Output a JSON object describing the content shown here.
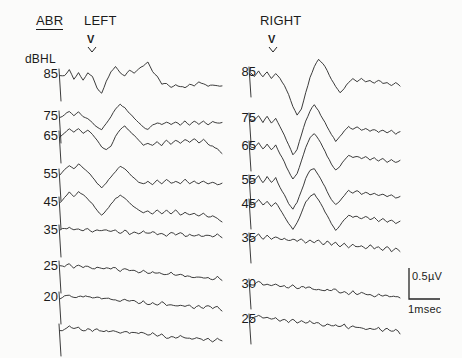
{
  "header": {
    "test_name": "ABR",
    "left_ear_label": "LEFT",
    "right_ear_label": "RIGHT",
    "intensity_unit": "dBHL",
    "wave_marker_left": "V",
    "wave_marker_right": "V"
  },
  "scalebar": {
    "amplitude_label": "0.5µV",
    "time_label": "1msec",
    "amplitude_value": 0.5,
    "amplitude_unit": "µV",
    "time_value": 1,
    "time_unit": "msec"
  },
  "left_levels": [
    "85",
    "75",
    "65",
    "55",
    "45",
    "35",
    "25",
    "20"
  ],
  "right_levels": [
    "85",
    "75",
    "65",
    "55",
    "45",
    "35",
    "30",
    "25"
  ],
  "chart_data": {
    "type": "line",
    "title": "ABR",
    "subtitle": "",
    "xlabel": "Time (msec)",
    "ylabel": "Stimulus intensity (dBHL)",
    "grid": false,
    "legend_position": "none",
    "annotations": [
      {
        "text": "V",
        "ear": "left",
        "meaning": "wave-V latency marker"
      },
      {
        "text": "V",
        "ear": "right",
        "meaning": "wave-V latency marker"
      }
    ],
    "amplitude_scale_uV": 0.5,
    "time_scale_msec": 1,
    "panels": [
      {
        "name": "LEFT",
        "ylabel": "dBHL",
        "categories": [
          "85",
          "75",
          "65",
          "55",
          "45",
          "35",
          "25",
          "20",
          ""
        ],
        "series": [
          {
            "name": "85 dBHL",
            "level": 85,
            "baseline_y": 75,
            "values": [
              0,
              -1,
              5,
              -5,
              3,
              -6,
              2,
              -1,
              -14,
              -19,
              -6,
              4,
              9,
              2,
              -1,
              5,
              2,
              6,
              10,
              13,
              4,
              -2,
              -10,
              -9,
              -13,
              -10,
              -12,
              -13,
              -10,
              -11,
              -8,
              -10,
              -12,
              -10,
              -12,
              -11
            ]
          },
          {
            "name": "75 dBHL",
            "level": 75,
            "baseline_y": 117,
            "values": [
              0,
              3,
              6,
              2,
              5,
              1,
              -2,
              -6,
              -11,
              -13,
              -6,
              1,
              8,
              13,
              10,
              4,
              -1,
              -6,
              -10,
              -13,
              -9,
              -6,
              -8,
              -5,
              -8,
              -5,
              -8,
              -4,
              -8,
              -5,
              -8,
              -5,
              -8,
              -5,
              -7,
              -5
            ]
          },
          {
            "name": "65 dBHL",
            "level": 65,
            "baseline_y": 137,
            "values": [
              0,
              4,
              8,
              5,
              9,
              4,
              7,
              2,
              -4,
              -10,
              -14,
              -9,
              0,
              7,
              12,
              7,
              2,
              -3,
              -8,
              -6,
              -9,
              -5,
              -9,
              -4,
              -8,
              -3,
              -7,
              -3,
              -6,
              -2,
              -6,
              -3,
              -7,
              -9,
              -13,
              -18
            ]
          },
          {
            "name": "55 dBHL",
            "level": 55,
            "baseline_y": 175,
            "values": [
              0,
              5,
              10,
              6,
              11,
              7,
              3,
              -2,
              -8,
              -13,
              -9,
              -3,
              4,
              10,
              7,
              2,
              -3,
              -7,
              -10,
              -7,
              -10,
              -6,
              -9,
              -5,
              -9,
              -6,
              -9,
              -5,
              -9,
              -6,
              -10,
              -7,
              -10,
              -8,
              -11,
              -9
            ]
          },
          {
            "name": "45 dBHL",
            "level": 45,
            "baseline_y": 203,
            "values": [
              0,
              6,
              11,
              7,
              12,
              8,
              4,
              -1,
              -7,
              -12,
              -8,
              -2,
              5,
              9,
              6,
              1,
              -4,
              -8,
              -11,
              -8,
              -11,
              -7,
              -11,
              -7,
              -12,
              -8,
              -12,
              -9,
              -13,
              -10,
              -14,
              -11,
              -15,
              -13,
              -17,
              -20
            ]
          },
          {
            "name": "35 dBHL",
            "level": 35,
            "baseline_y": 231,
            "values": [
              0,
              2,
              5,
              1,
              4,
              1,
              3,
              0,
              2,
              -1,
              1,
              -2,
              1,
              -2,
              0,
              -3,
              -1,
              -4,
              -1,
              -4,
              -2,
              -5,
              -2,
              -5,
              -3,
              -6,
              -3,
              -6,
              -4,
              -7,
              -4,
              -7,
              -5,
              -8,
              -5,
              -8
            ]
          },
          {
            "name": "25 dBHL",
            "level": 25,
            "baseline_y": 267,
            "values": [
              0,
              1,
              3,
              0,
              2,
              -1,
              1,
              -2,
              0,
              -3,
              -1,
              -4,
              -2,
              -5,
              -3,
              -6,
              -4,
              -7,
              -5,
              -8,
              -6,
              -9,
              -7,
              -10,
              -8,
              -11,
              -9,
              -12,
              -10,
              -13,
              -11,
              -14,
              -12,
              -15,
              -13,
              -16
            ]
          },
          {
            "name": "20 dBHL",
            "level": 20,
            "baseline_y": 298,
            "values": [
              0,
              2,
              4,
              1,
              3,
              0,
              2,
              -1,
              1,
              -2,
              0,
              -3,
              -1,
              -4,
              -2,
              -5,
              -3,
              -6,
              -4,
              -7,
              -5,
              -8,
              -6,
              -9,
              -7,
              -10,
              -8,
              -11,
              -9,
              -12,
              -10,
              -13,
              -11,
              -14,
              -12,
              -15
            ]
          },
          {
            "name": "unlabeled repeat",
            "level": null,
            "baseline_y": 330,
            "values": [
              0,
              2,
              4,
              1,
              3,
              0,
              2,
              -1,
              1,
              -2,
              0,
              -3,
              -1,
              -4,
              -2,
              -5,
              -3,
              -6,
              -4,
              -7,
              -5,
              -8,
              -6,
              -9,
              -7,
              -10,
              -8,
              -11,
              -9,
              -12,
              -10,
              -13,
              -11,
              -14,
              -12,
              -15
            ]
          }
        ]
      },
      {
        "name": "RIGHT",
        "ylabel": "dBHL",
        "categories": [
          "85",
          "75",
          "65",
          "55",
          "45",
          "35",
          "30",
          "25"
        ],
        "series": [
          {
            "name": "85 dBHL",
            "level": 85,
            "baseline_y": 73,
            "values": [
              0,
              -3,
              2,
              -4,
              1,
              -5,
              0,
              -6,
              -12,
              -22,
              -34,
              -42,
              -36,
              -20,
              -4,
              6,
              14,
              10,
              2,
              -6,
              -14,
              -20,
              -16,
              -10,
              -6,
              -8,
              -6,
              -9,
              -7,
              -10,
              -8,
              -11,
              -9,
              -12,
              -10,
              -13
            ]
          },
          {
            "name": "75 dBHL",
            "level": 75,
            "baseline_y": 119,
            "values": [
              0,
              -2,
              3,
              -3,
              2,
              -4,
              1,
              -8,
              -16,
              -26,
              -36,
              -30,
              -16,
              -2,
              8,
              14,
              8,
              0,
              -8,
              -16,
              -22,
              -18,
              -12,
              -8,
              -10,
              -8,
              -11,
              -9,
              -12,
              -10,
              -13,
              -11,
              -14,
              -12,
              -15,
              -13
            ]
          },
          {
            "name": "65 dBHL",
            "level": 65,
            "baseline_y": 147,
            "values": [
              0,
              -1,
              4,
              -2,
              3,
              -3,
              2,
              -7,
              -15,
              -24,
              -32,
              -26,
              -14,
              0,
              9,
              13,
              7,
              -1,
              -9,
              -17,
              -23,
              -19,
              -13,
              -9,
              -11,
              -9,
              -12,
              -10,
              -13,
              -11,
              -14,
              -12,
              -15,
              -13,
              -16,
              -14
            ]
          },
          {
            "name": "55 dBHL",
            "level": 55,
            "baseline_y": 181,
            "values": [
              0,
              0,
              5,
              -1,
              4,
              -2,
              3,
              -6,
              -14,
              -22,
              -28,
              -22,
              -10,
              2,
              10,
              12,
              6,
              -2,
              -10,
              -18,
              -24,
              -20,
              -14,
              -10,
              -12,
              -10,
              -13,
              -11,
              -14,
              -12,
              -15,
              -13,
              -16,
              -14,
              -17,
              -15
            ]
          },
          {
            "name": "45 dBHL",
            "level": 45,
            "baseline_y": 205,
            "values": [
              0,
              1,
              5,
              0,
              4,
              -1,
              3,
              -5,
              -12,
              -19,
              -24,
              -18,
              -8,
              3,
              9,
              11,
              5,
              -3,
              -11,
              -19,
              -25,
              -21,
              -15,
              -11,
              -13,
              -11,
              -14,
              -12,
              -15,
              -13,
              -16,
              -14,
              -17,
              -15,
              -18,
              -16
            ]
          },
          {
            "name": "35 dBHL",
            "level": 35,
            "baseline_y": 239,
            "values": [
              0,
              2,
              5,
              1,
              4,
              0,
              3,
              -1,
              2,
              -2,
              1,
              -3,
              0,
              -4,
              -1,
              -5,
              -2,
              -6,
              -3,
              -7,
              -4,
              -8,
              -5,
              -9,
              -6,
              -10,
              -7,
              -11,
              -8,
              -12,
              -9,
              -13,
              -10,
              -14,
              -11,
              -15
            ]
          },
          {
            "name": "30 dBHL",
            "level": 30,
            "baseline_y": 285,
            "values": [
              0,
              1,
              3,
              0,
              2,
              -1,
              1,
              -2,
              0,
              -3,
              -1,
              -4,
              -2,
              -5,
              -3,
              -6,
              -4,
              -7,
              -5,
              -8,
              -6,
              -9,
              -7,
              -10,
              -8,
              -11,
              -9,
              -12,
              -10,
              -13,
              -11,
              -14,
              -12,
              -15,
              -13,
              -16
            ]
          },
          {
            "name": "25 dBHL",
            "level": 25,
            "baseline_y": 320,
            "values": [
              0,
              2,
              4,
              1,
              3,
              0,
              2,
              -1,
              1,
              -2,
              0,
              -3,
              -1,
              -4,
              -2,
              -5,
              -3,
              -6,
              -4,
              -7,
              -5,
              -8,
              -6,
              -9,
              -7,
              -10,
              -8,
              -11,
              -9,
              -12,
              -10,
              -13,
              -11,
              -14,
              -12,
              -15
            ]
          }
        ]
      }
    ]
  },
  "style": {
    "trace_color": "#262626",
    "text_color": "#1b1b1b",
    "background": "#fbfbfa"
  }
}
